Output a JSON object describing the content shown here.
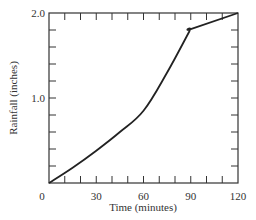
{
  "chart_data": {
    "type": "line",
    "title": "",
    "xlabel": "Time (minutes)",
    "ylabel": "Rainfall (inches)",
    "xlim": [
      0,
      120
    ],
    "ylim": [
      0,
      2.0
    ],
    "x_tick_labels": [
      "0",
      "30",
      "60",
      "90",
      "120"
    ],
    "x_tick_values": [
      0,
      30,
      60,
      90,
      120
    ],
    "x_minor_tick_step": 10,
    "y_tick_labels": [
      "1.0",
      "2.0"
    ],
    "y_tick_values": [
      1.0,
      2.0
    ],
    "y_minor_tick_step": 0.2,
    "grid": false,
    "legend": null,
    "series": [
      {
        "name": "Cumulative rainfall",
        "x": [
          0,
          15,
          30,
          45,
          60,
          75,
          89,
          90,
          120
        ],
        "values": [
          0,
          0.18,
          0.38,
          0.6,
          0.85,
          1.3,
          1.78,
          1.81,
          2.0
        ]
      }
    ],
    "colors": {
      "line": "#222222",
      "axis": "#333333"
    }
  }
}
